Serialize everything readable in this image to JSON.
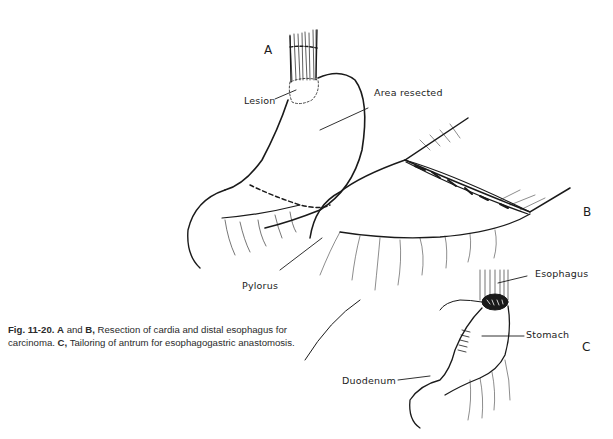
{
  "figure": {
    "panels": {
      "a": "A",
      "b": "B",
      "c": "C"
    },
    "labels": {
      "lesion": "Lesion",
      "area_resected": "Area resected",
      "pylorus": "Pylorus",
      "esophagus": "Esophagus",
      "stomach": "Stomach",
      "duodenum": "Duodenum"
    },
    "caption": {
      "fig_number": "Fig. 11-20.",
      "a_label": "A",
      "and": " and ",
      "b_label": "B,",
      "part1": " Resection of cardia and distal esophagus for carcinoma. ",
      "c_label": "C,",
      "part2": " Tailoring of antrum for esophagogastric anastomosis."
    }
  }
}
